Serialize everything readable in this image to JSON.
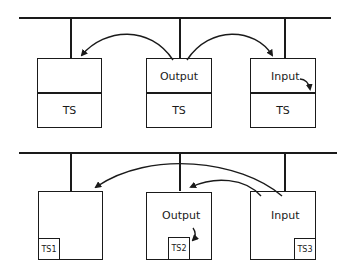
{
  "top_diagram": {
    "boxes": [
      {
        "id": "left",
        "top_label": "",
        "bottom_label": "TS"
      },
      {
        "id": "middle",
        "top_label": "Output",
        "bottom_label": "TS"
      },
      {
        "id": "right",
        "top_label": "Input",
        "bottom_label": "TS"
      }
    ]
  },
  "bottom_diagram": {
    "boxes": [
      {
        "id": "left",
        "label": "",
        "inset_label": "TS1"
      },
      {
        "id": "middle",
        "label": "Output",
        "inset_label": "TS2"
      },
      {
        "id": "right",
        "label": "Input",
        "inset_label": "TS3"
      }
    ]
  },
  "colors": {
    "line": "#1a1a1a",
    "background": "#ffffff"
  }
}
